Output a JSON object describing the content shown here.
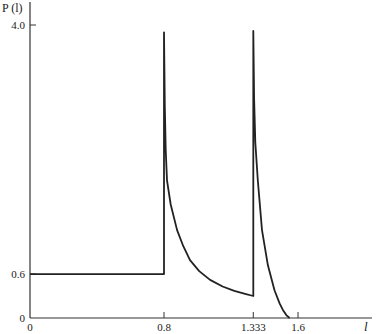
{
  "chart_data": {
    "type": "line",
    "title": "",
    "xlabel": "l",
    "ylabel": "P (l)",
    "xlim": [
      0,
      2.0
    ],
    "ylim": [
      0,
      4.0
    ],
    "grid": false,
    "legend": "none",
    "x_ticks": [
      {
        "value": 0,
        "label": "0"
      },
      {
        "value": 0.8,
        "label": "0.8"
      },
      {
        "value": 1.333,
        "label": "1.333"
      },
      {
        "value": 1.6,
        "label": "1.6"
      }
    ],
    "y_ticks": [
      {
        "value": 0,
        "label": "0"
      },
      {
        "value": 0.6,
        "label": "0.6"
      },
      {
        "value": 4.0,
        "label": "4.0"
      }
    ],
    "series": [
      {
        "name": "P(l)",
        "points": [
          [
            0,
            0.6
          ],
          [
            0.8,
            0.6
          ],
          [
            0.8,
            3.9
          ],
          [
            0.805,
            2.9
          ],
          [
            0.81,
            2.3
          ],
          [
            0.818,
            1.88
          ],
          [
            0.84,
            1.55
          ],
          [
            0.878,
            1.2
          ],
          [
            0.915,
            0.98
          ],
          [
            0.955,
            0.79
          ],
          [
            1.01,
            0.64
          ],
          [
            1.075,
            0.52
          ],
          [
            1.15,
            0.43
          ],
          [
            1.22,
            0.37
          ],
          [
            1.284,
            0.33
          ],
          [
            1.333,
            0.3
          ],
          [
            1.333,
            3.92
          ],
          [
            1.338,
            3.0
          ],
          [
            1.345,
            2.4
          ],
          [
            1.36,
            1.88
          ],
          [
            1.385,
            1.2
          ],
          [
            1.42,
            0.72
          ],
          [
            1.46,
            0.38
          ],
          [
            1.49,
            0.2
          ],
          [
            1.51,
            0.11
          ],
          [
            1.53,
            0.04
          ],
          [
            1.55,
            0
          ]
        ]
      }
    ]
  }
}
